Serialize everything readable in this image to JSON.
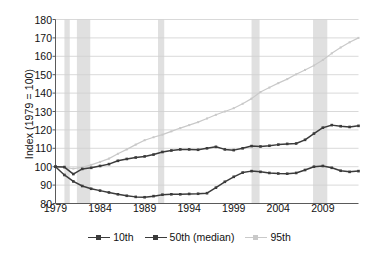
{
  "chart_data": {
    "type": "line",
    "title": "",
    "xlabel": "",
    "ylabel": "Index (1979 = 100)",
    "xlim": [
      1979,
      2013
    ],
    "ylim": [
      80,
      180
    ],
    "ytick_labels": [
      "80",
      "90",
      "100",
      "110",
      "120",
      "130",
      "140",
      "150",
      "160",
      "170",
      "180"
    ],
    "yticks": [
      80,
      90,
      100,
      110,
      120,
      130,
      140,
      150,
      160,
      170,
      180
    ],
    "xtick_labels": [
      "1979",
      "1984",
      "1989",
      "1994",
      "1999",
      "2004",
      "2009"
    ],
    "xticks": [
      1979,
      1984,
      1989,
      1994,
      1999,
      2004,
      2009
    ],
    "grid": "horizontal",
    "legend_position": "bottom-center",
    "markers": "square",
    "x": [
      1979,
      1980,
      1981,
      1982,
      1983,
      1984,
      1985,
      1986,
      1987,
      1988,
      1989,
      1990,
      1991,
      1992,
      1993,
      1994,
      1995,
      1996,
      1997,
      1998,
      1999,
      2000,
      2001,
      2002,
      2003,
      2004,
      2005,
      2006,
      2007,
      2008,
      2009,
      2010,
      2011,
      2012,
      2013
    ],
    "series": [
      {
        "name": "10th",
        "color": "#3b3b3b",
        "values": [
          100.0,
          95.5,
          92.0,
          89.5,
          88.0,
          87.0,
          86.0,
          85.0,
          84.2,
          83.6,
          83.4,
          84.0,
          84.8,
          85.0,
          85.0,
          85.2,
          85.3,
          85.6,
          88.6,
          91.8,
          94.5,
          96.8,
          97.6,
          97.2,
          96.6,
          96.3,
          96.2,
          96.6,
          98.2,
          100.0,
          100.4,
          99.4,
          97.8,
          97.2,
          97.6
        ]
      },
      {
        "name": "50th (median)",
        "color": "#3b3b3b",
        "values": [
          100.0,
          99.8,
          96.0,
          98.8,
          99.4,
          100.4,
          101.4,
          103.2,
          104.2,
          105.0,
          105.6,
          106.6,
          108.0,
          108.8,
          109.4,
          109.4,
          109.2,
          110.0,
          110.8,
          109.4,
          109.0,
          110.0,
          111.2,
          111.0,
          111.4,
          112.0,
          112.4,
          112.6,
          114.6,
          118.0,
          121.2,
          122.6,
          122.0,
          121.6,
          122.2
        ]
      },
      {
        "name": "95th",
        "color": "#c9c9c9",
        "values": [
          100.0,
          99.6,
          99.0,
          99.6,
          101.0,
          102.6,
          104.4,
          107.0,
          109.4,
          112.0,
          114.4,
          116.0,
          117.4,
          119.2,
          121.0,
          122.6,
          124.2,
          126.2,
          128.2,
          130.0,
          131.8,
          134.2,
          137.0,
          140.6,
          143.0,
          145.4,
          147.6,
          150.2,
          152.6,
          155.0,
          158.0,
          161.6,
          164.8,
          167.6,
          170.0
        ]
      }
    ],
    "recession_bands": [
      {
        "start": 1980.0,
        "end": 1980.6
      },
      {
        "start": 1981.4,
        "end": 1982.9
      },
      {
        "start": 1990.5,
        "end": 1991.2
      },
      {
        "start": 2001.0,
        "end": 2001.9
      },
      {
        "start": 2007.9,
        "end": 2009.5
      }
    ],
    "recession_band_color": "#e0e0e0"
  },
  "legend": {
    "entries": [
      {
        "label": "10th"
      },
      {
        "label": "50th (median)"
      },
      {
        "label": "95th"
      }
    ]
  }
}
